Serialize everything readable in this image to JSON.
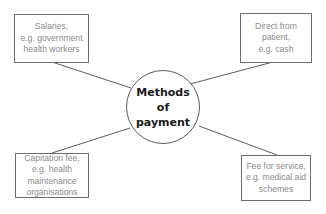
{
  "diagram": {
    "center": {
      "lines": [
        "Methods",
        "of",
        "payment"
      ]
    },
    "nodes": [
      {
        "id": "top-left",
        "lines": [
          "Salaries,",
          "e.g. government",
          "health workers"
        ]
      },
      {
        "id": "top-right",
        "lines": [
          "Direct from",
          "patient,",
          "e.g. cash"
        ]
      },
      {
        "id": "bottom-left",
        "lines": [
          "Capitation fee,",
          "e.g. health",
          "maintenance",
          "organisations"
        ]
      },
      {
        "id": "bottom-right",
        "lines": [
          "Fee for service,",
          "e.g. medical aid",
          "schemes"
        ]
      }
    ],
    "colors": {
      "box_border": "#6e6e6e",
      "box_text": "#8a8a8a",
      "center_text": "#1a1a1a",
      "connector": "#4a4a4a"
    }
  }
}
